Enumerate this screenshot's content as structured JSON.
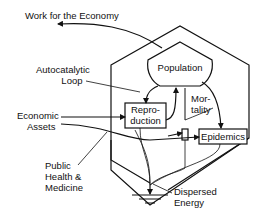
{
  "diagram": {
    "nodes": {
      "population": "Population",
      "reproduction_line1": "Repro-",
      "reproduction_line2": "duction",
      "epidemics": "Epidemics"
    },
    "flow_labels": {
      "mortality_line1": "Mor-",
      "mortality_line2": "tality"
    },
    "external_labels": {
      "work_for_economy": "Work for the Economy",
      "autocatalytic_line1": "Autocatalytic",
      "autocatalytic_line2": "Loop",
      "economic_line1": "Economic",
      "economic_line2": "Assets",
      "public_health_line1": "Public",
      "public_health_line2": "Health  &",
      "public_health_line3": "Medicine",
      "dispersed_line1": "Dispersed",
      "dispersed_line2": "Energy"
    },
    "colors": {
      "stroke": "#111111",
      "background": "#ffffff"
    }
  }
}
